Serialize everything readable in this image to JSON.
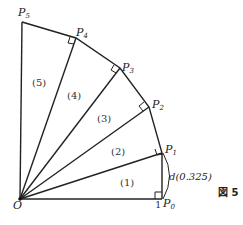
{
  "figure": {
    "caption": "図 5",
    "origin_label": "O",
    "unit_label": "1",
    "segment_label": "d(0.325)",
    "points": [
      {
        "name": "P",
        "sub": "0"
      },
      {
        "name": "P",
        "sub": "1"
      },
      {
        "name": "P",
        "sub": "2"
      },
      {
        "name": "P",
        "sub": "3"
      },
      {
        "name": "P",
        "sub": "4"
      },
      {
        "name": "P",
        "sub": "5"
      }
    ],
    "regions": [
      "(1)",
      "(2)",
      "(3)",
      "(4)",
      "(5)"
    ]
  }
}
